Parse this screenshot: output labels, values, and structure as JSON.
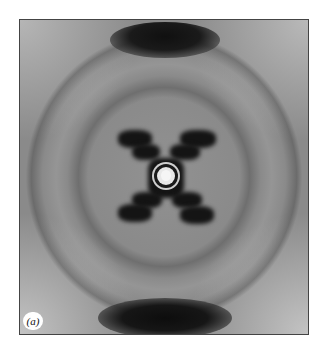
{
  "figure": {
    "panel_label": "(a)",
    "colors": {
      "background": "#8a8a8a",
      "dark_reflection": "#141414",
      "page": "#ffffff",
      "border": "#444444"
    }
  }
}
